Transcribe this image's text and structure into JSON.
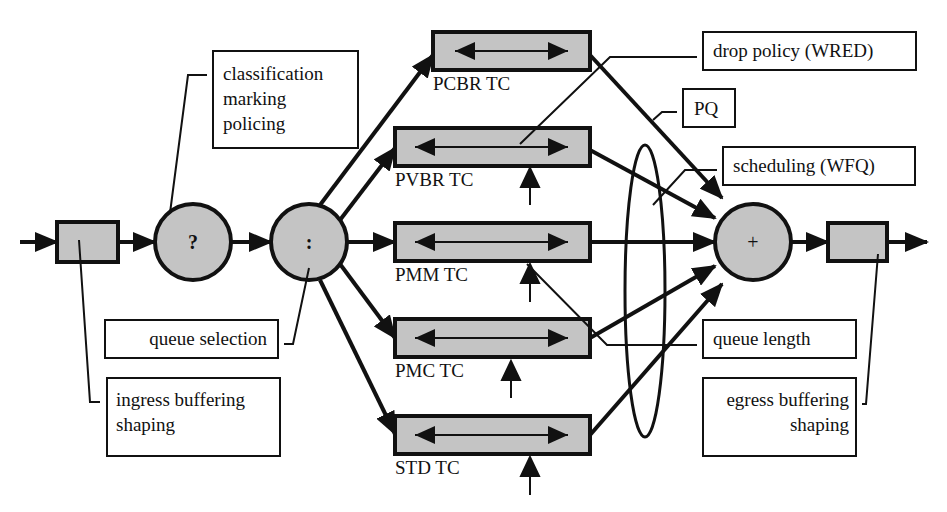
{
  "diagram": {
    "type": "router-qos-architecture",
    "colors": {
      "fill_gray": "#c4c4c4",
      "stroke": "#111111",
      "background": "#ffffff"
    },
    "nodes": {
      "ingress_buffer": {
        "label": ""
      },
      "classifier": {
        "symbol": "?"
      },
      "queue_selector": {
        "symbol": ":"
      },
      "scheduler": {
        "symbol": "+"
      },
      "egress_buffer": {
        "label": ""
      }
    },
    "queues": [
      {
        "id": "pcbr",
        "label": "PCBR TC"
      },
      {
        "id": "pvbr",
        "label": "PVBR TC"
      },
      {
        "id": "pmm",
        "label": "PMM TC"
      },
      {
        "id": "pmc",
        "label": "PMC TC"
      },
      {
        "id": "std",
        "label": "STD TC"
      }
    ],
    "annotations": {
      "classification": [
        "classification",
        "marking",
        "policing"
      ],
      "queue_selection": "queue selection",
      "ingress": [
        "ingress buffering",
        "shaping"
      ],
      "drop_policy": "drop policy (WRED)",
      "pq": "PQ",
      "scheduling": "scheduling (WFQ)",
      "queue_length": "queue length",
      "egress": [
        "egress buffering",
        "shaping"
      ]
    }
  }
}
